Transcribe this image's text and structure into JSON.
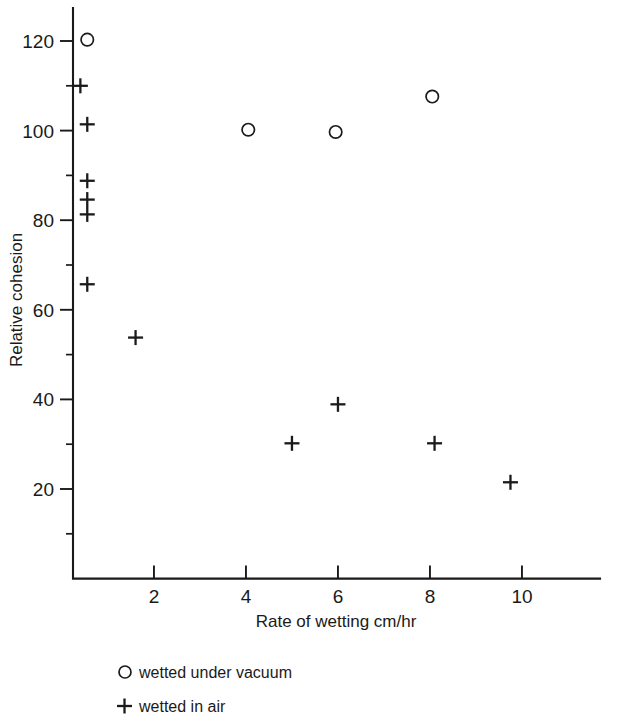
{
  "chart_data": {
    "type": "scatter",
    "title": "",
    "xlabel": "Rate of wetting  cm/hr",
    "ylabel": "Relative cohesion",
    "xlim": [
      0,
      11.8
    ],
    "ylim": [
      0,
      129
    ],
    "grid": false,
    "xticks": [
      2,
      4,
      6,
      8,
      10
    ],
    "xticklabels": [
      "2",
      "4",
      "6",
      "8",
      "10"
    ],
    "yticks": [
      20,
      40,
      60,
      80,
      100,
      120
    ],
    "yticklabels": [
      "20",
      "40",
      "60",
      "80",
      "100",
      "120"
    ],
    "y_minor_ticks": [
      10,
      30,
      50,
      70,
      90,
      110
    ],
    "legend_position": "below-axes",
    "series": [
      {
        "name": "wetted under vacuum",
        "marker": "circle",
        "points": [
          {
            "x": 0.55,
            "y": 120.3
          },
          {
            "x": 4.05,
            "y": 100.2
          },
          {
            "x": 5.95,
            "y": 99.7
          },
          {
            "x": 8.05,
            "y": 107.6
          }
        ]
      },
      {
        "name": "wetted in air",
        "marker": "plus",
        "points": [
          {
            "x": 0.4,
            "y": 110.0
          },
          {
            "x": 0.55,
            "y": 101.4
          },
          {
            "x": 0.55,
            "y": 88.8
          },
          {
            "x": 0.55,
            "y": 84.6
          },
          {
            "x": 0.55,
            "y": 81.3
          },
          {
            "x": 0.55,
            "y": 65.7
          },
          {
            "x": 1.6,
            "y": 53.8
          },
          {
            "x": 6.0,
            "y": 38.9
          },
          {
            "x": 5.0,
            "y": 30.2
          },
          {
            "x": 8.1,
            "y": 30.2
          },
          {
            "x": 9.75,
            "y": 21.5
          }
        ]
      }
    ]
  },
  "legend": {
    "entries": [
      {
        "marker": "circle",
        "label": "wetted under vacuum"
      },
      {
        "marker": "plus",
        "label": "wetted in air"
      }
    ]
  },
  "colors": {
    "ink": "#1a1a1a",
    "background": "#ffffff"
  }
}
